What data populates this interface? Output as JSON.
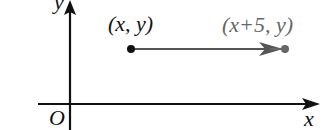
{
  "diagram": {
    "type": "coordinate-translation",
    "axes": {
      "x_label": "x",
      "y_label": "y",
      "origin_label": "O"
    },
    "points": {
      "start": {
        "label": "(x, y)",
        "color": "#111111"
      },
      "end": {
        "label": "(x+5, y)",
        "color": "#666666"
      }
    },
    "translation": {
      "description": "horizontal shift right by 5",
      "arrow_color": "#555555"
    },
    "colors": {
      "axis": "#111111",
      "background": "#ffffff"
    }
  }
}
